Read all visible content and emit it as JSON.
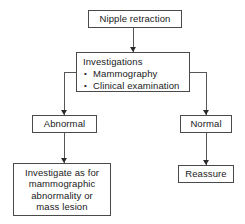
{
  "diagram": {
    "type": "flowchart",
    "background_color": "#ffffff",
    "border_color": "#4a4a4a",
    "connector_color": "#55565a",
    "text_color": "#1a1a1a"
  },
  "nodes": {
    "root": {
      "label": "Nipple retraction"
    },
    "investigations": {
      "heading": "Investigations",
      "bullet_glyph": "•",
      "items": [
        "Mammography",
        "Clinical examination"
      ]
    },
    "abnormal": {
      "label": "Abnormal"
    },
    "normal": {
      "label": "Normal"
    },
    "investigate_further": {
      "label": "Investigate as for\nmammographic\nabnormality or\nmass lesion"
    },
    "reassure": {
      "label": "Reassure"
    }
  }
}
